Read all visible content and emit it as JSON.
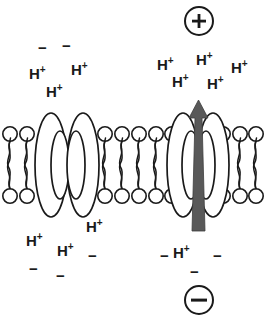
{
  "diagram": {
    "type": "biology-cell-membrane-diagram",
    "colors": {
      "stroke": "#1a1a1a",
      "arrow_fill": "#595959",
      "background": "#ffffff",
      "protein_fill": "#ffffff"
    }
  },
  "polarity": {
    "top_label": "+",
    "top_name": "positive-charge-symbol",
    "bottom_label": "−",
    "bottom_name": "negative-charge-symbol"
  },
  "membrane": {
    "label": "lipid-bilayer",
    "lipid_head_count_top": 11,
    "lipid_head_count_bottom": 11
  },
  "proteins": [
    {
      "name": "ion-channel-protein-left",
      "has_arrow": false
    },
    {
      "name": "proton-pump-protein-right",
      "has_arrow": true
    }
  ],
  "flow_arrow": {
    "name": "proton-flow-arrow",
    "direction": "up",
    "description": "Protons move upward through the right protein"
  },
  "ions": {
    "upper_left": [
      {
        "type": "minus",
        "text": "−",
        "x": 38,
        "y": 40
      },
      {
        "type": "minus",
        "text": "−",
        "x": 62,
        "y": 38
      },
      {
        "type": "proton",
        "text": "H",
        "sup": "+",
        "x": 29,
        "y": 66
      },
      {
        "type": "proton",
        "text": "H",
        "sup": "+",
        "x": 71,
        "y": 62
      },
      {
        "type": "proton",
        "text": "H",
        "sup": "+",
        "x": 46,
        "y": 84
      }
    ],
    "upper_right": [
      {
        "type": "proton",
        "text": "H",
        "sup": "+",
        "x": 157,
        "y": 57
      },
      {
        "type": "proton",
        "text": "H",
        "sup": "+",
        "x": 196,
        "y": 52
      },
      {
        "type": "proton",
        "text": "H",
        "sup": "+",
        "x": 231,
        "y": 60
      },
      {
        "type": "proton",
        "text": "H",
        "sup": "+",
        "x": 172,
        "y": 74
      },
      {
        "type": "proton",
        "text": "H",
        "sup": "+",
        "x": 207,
        "y": 76
      }
    ],
    "lower_left": [
      {
        "type": "proton",
        "text": "H",
        "sup": "+",
        "x": 86,
        "y": 219
      },
      {
        "type": "proton",
        "text": "H",
        "sup": "+",
        "x": 26,
        "y": 233
      },
      {
        "type": "proton",
        "text": "H",
        "sup": "+",
        "x": 57,
        "y": 243
      },
      {
        "type": "minus",
        "text": "−",
        "x": 88,
        "y": 248
      },
      {
        "type": "minus",
        "text": "−",
        "x": 29,
        "y": 261
      },
      {
        "type": "minus",
        "text": "−",
        "x": 56,
        "y": 268
      }
    ],
    "lower_right": [
      {
        "type": "minus",
        "text": "−",
        "x": 160,
        "y": 248
      },
      {
        "type": "proton",
        "text": "H",
        "sup": "+",
        "x": 173,
        "y": 245
      },
      {
        "type": "minus",
        "text": "−",
        "x": 213,
        "y": 248
      },
      {
        "type": "minus",
        "text": "−",
        "x": 190,
        "y": 264
      }
    ]
  }
}
